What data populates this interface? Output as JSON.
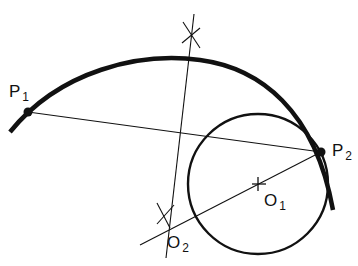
{
  "diagram": {
    "type": "geometric construction",
    "labels": {
      "p1": {
        "main": "P",
        "sub": "1"
      },
      "p2": {
        "main": "P",
        "sub": "2"
      },
      "o1": {
        "main": "O",
        "sub": "1"
      },
      "o2": {
        "main": "O",
        "sub": "2"
      }
    },
    "elements": [
      "large arc through P1 and P2 (thick)",
      "circle centered at O1 tangent to arc at P2",
      "chord P1-P2",
      "perpendicular bisector of chord P1-P2 with construction marks",
      "line from P2 through O1 extended to O2"
    ],
    "colors": {
      "stroke": "#111111",
      "background": "#ffffff"
    }
  }
}
